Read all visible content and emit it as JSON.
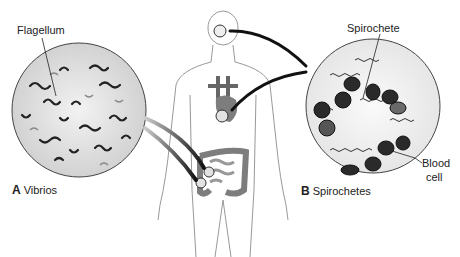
{
  "figure": {
    "panel_a": {
      "letter": "A",
      "title": "Vibrios",
      "callout": "Flagellum"
    },
    "panel_b": {
      "letter": "B",
      "title": "Spirochetes",
      "callouts": [
        "Spirochete",
        "Blood",
        "cell"
      ]
    },
    "body_sites": [
      "brain",
      "heart",
      "intestine"
    ],
    "colors": {
      "line": "#333333",
      "organ": "#7d7d7d",
      "circle_fill": "#e2e2e2",
      "cell": "#2a2a2a"
    }
  }
}
